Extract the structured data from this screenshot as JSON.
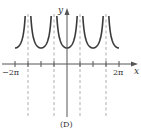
{
  "chart_data": {
    "type": "line",
    "title": "",
    "caption": "(D)",
    "function": "y = |sec x|",
    "xlabel": "x",
    "ylabel": "y",
    "xlim": [
      -2.0944,
      2.0944
    ],
    "x_unit": "pi",
    "x_range_pi": [
      -2.1,
      2.3
    ],
    "x_ticks_pi": [
      -2,
      -1.5,
      -1,
      -0.5,
      0,
      0.5,
      1,
      1.5,
      2
    ],
    "x_tick_labels": [
      {
        "at_pi": -2,
        "label": "−2π"
      },
      {
        "at_pi": 2,
        "label": "2π"
      }
    ],
    "asymptotes_pi": [
      -1.5,
      -0.5,
      0.5,
      1.5
    ],
    "minima": [
      {
        "x_pi": -2,
        "y": 1
      },
      {
        "x_pi": -1,
        "y": 1
      },
      {
        "x_pi": 0,
        "y": 1
      },
      {
        "x_pi": 1,
        "y": 1
      },
      {
        "x_pi": 2,
        "y": 1
      }
    ],
    "grid": false,
    "legend": null,
    "colors": {
      "curve": "#3a3a3a",
      "axis": "#555555",
      "asymptote": "#9a9a9a"
    }
  },
  "labels": {
    "x_axis": "x",
    "y_axis": "y",
    "tick_neg_2pi": "−2π",
    "tick_pos_2pi": "2π",
    "caption": "(D)"
  }
}
